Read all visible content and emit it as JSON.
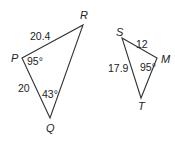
{
  "diagram": {
    "triangles": [
      {
        "name": "PQR",
        "vertices": {
          "P": {
            "label": "P",
            "x": 22,
            "y": 58,
            "lx": 11,
            "ly": 62
          },
          "Q": {
            "label": "Q",
            "x": 50,
            "y": 118,
            "lx": 46,
            "ly": 132
          },
          "R": {
            "label": "R",
            "x": 83,
            "y": 25,
            "lx": 80,
            "ly": 19
          }
        },
        "sides": [
          {
            "between": "PR",
            "label": "20.4",
            "x": 30,
            "y": 40
          },
          {
            "between": "PQ",
            "label": "20",
            "x": 18,
            "y": 92
          }
        ],
        "angles": [
          {
            "at": "P",
            "label": "95°",
            "x": 27,
            "y": 65
          },
          {
            "at": "Q",
            "label": "43°",
            "x": 42,
            "y": 98
          }
        ]
      },
      {
        "name": "SMT",
        "vertices": {
          "S": {
            "label": "S",
            "x": 122,
            "y": 38,
            "lx": 116,
            "ly": 36
          },
          "M": {
            "label": "M",
            "x": 157,
            "y": 58,
            "lx": 161,
            "ly": 63
          },
          "T": {
            "label": "T",
            "x": 141,
            "y": 98,
            "lx": 138,
            "ly": 110
          }
        },
        "sides": [
          {
            "between": "SM",
            "label": "12",
            "x": 136,
            "y": 48
          },
          {
            "between": "ST",
            "label": "17.9",
            "x": 108,
            "y": 72
          }
        ],
        "angles": [
          {
            "at": "M",
            "label": "95°",
            "x": 140,
            "y": 71
          }
        ]
      }
    ]
  }
}
